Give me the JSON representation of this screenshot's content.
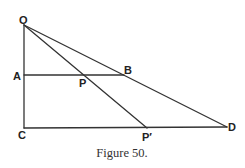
{
  "diagram": {
    "caption": "Figure 50.",
    "colors": {
      "line": "#333333",
      "label": "#222222",
      "background": "#ffffff"
    },
    "points": {
      "O": {
        "label": "O",
        "x": 24,
        "y": 25
      },
      "A": {
        "label": "A",
        "x": 24,
        "y": 75
      },
      "C": {
        "label": "C",
        "x": 24,
        "y": 128
      },
      "B": {
        "label": "B",
        "x": 124,
        "y": 75
      },
      "P": {
        "label": "P",
        "x": 84,
        "y": 75
      },
      "P_prime": {
        "label": "P′",
        "x": 147,
        "y": 128
      },
      "D": {
        "label": "D",
        "x": 227,
        "y": 127
      }
    },
    "segments": [
      {
        "from": "O",
        "to": "C"
      },
      {
        "from": "A",
        "to": "B"
      },
      {
        "from": "C",
        "to": "D"
      },
      {
        "from": "O",
        "to": "D"
      },
      {
        "from": "O",
        "to": "P_prime"
      }
    ]
  }
}
